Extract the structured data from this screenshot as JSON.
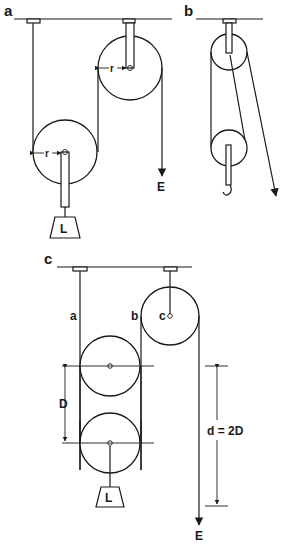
{
  "figure": {
    "panels": [
      {
        "id": "a",
        "label": "a",
        "load_label": "L",
        "effort_label": "E",
        "radius_labels": [
          "r",
          "r"
        ]
      },
      {
        "id": "b",
        "label": "b"
      },
      {
        "id": "c",
        "label": "c",
        "rope_labels": [
          "a",
          "b"
        ],
        "pulley_label": "c",
        "load_label": "L",
        "effort_label": "E",
        "dimension_D": "D",
        "dimension_d": "d = 2D"
      }
    ],
    "colors": {
      "line": "#1a1a1a",
      "background": "#ffffff"
    }
  }
}
